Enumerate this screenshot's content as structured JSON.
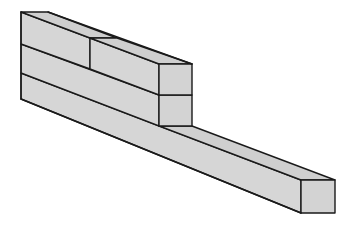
{
  "diagram": {
    "colors": {
      "face": "#d3d3d3",
      "stroke": "#1a1a1a",
      "background": "#ffffff"
    },
    "blocks": [
      {
        "name": "top-left-block",
        "layer": 1
      },
      {
        "name": "top-right-block",
        "layer": 1
      },
      {
        "name": "middle-beam",
        "layer": 2
      },
      {
        "name": "long-bottom-beam",
        "layer": 3
      }
    ]
  }
}
